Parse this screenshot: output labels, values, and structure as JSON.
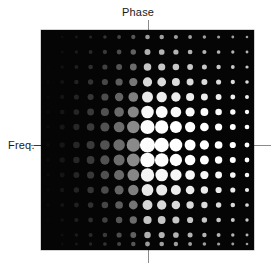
{
  "figure": {
    "title": "",
    "background_color": "#ffffff",
    "plot_background_color": "#050505",
    "guide_color": "#8c8c8c"
  },
  "labels": {
    "phase": "Phase",
    "freq": "Freq."
  },
  "chart_data": {
    "type": "scatter",
    "title": "",
    "xlabel": "Phase",
    "ylabel": "Freq.",
    "grid": false,
    "legend": false,
    "n_cols": 15,
    "n_rows": 15,
    "col_centers_px": [
      48,
      62.2,
      76.4,
      90.6,
      104.9,
      119.1,
      133.3,
      147.5,
      161.7,
      175.9,
      190.1,
      204.4,
      218.6,
      232.8,
      247
    ],
    "row_centers_px": [
      37,
      52,
      67,
      82,
      97,
      112,
      127,
      145,
      160,
      175,
      190,
      205,
      220,
      235,
      244
    ],
    "center_col_index": 7,
    "center_row_index": 7,
    "radius_envelope_cols": [
      0.18,
      0.26,
      0.35,
      0.46,
      0.58,
      0.72,
      0.86,
      1.0,
      0.93,
      0.82,
      0.68,
      0.55,
      0.43,
      0.32,
      0.22
    ],
    "radius_envelope_rows": [
      0.2,
      0.3,
      0.42,
      0.55,
      0.68,
      0.8,
      0.92,
      1.0,
      0.95,
      0.86,
      0.74,
      0.6,
      0.47,
      0.34,
      0.22
    ],
    "max_radius_px": 7.6,
    "min_radius_px": 1.0,
    "brightness_by_col": [
      10,
      22,
      38,
      58,
      82,
      108,
      138,
      252,
      255,
      255,
      255,
      255,
      255,
      255,
      255
    ],
    "brightness_row_falloff": [
      0.62,
      0.7,
      0.78,
      0.86,
      0.93,
      0.98,
      1.0,
      1.0,
      1.0,
      0.97,
      0.92,
      0.85,
      0.78,
      0.7,
      0.62
    ],
    "axis_marker_phase_value": "0",
    "axis_marker_freq_value": "0"
  }
}
